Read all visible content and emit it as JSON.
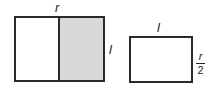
{
  "diagram": {
    "left_rectangle": {
      "top_label": "r",
      "side_label": "l",
      "shaded_half": "right",
      "shade_color": "#d8d8d8"
    },
    "right_rectangle": {
      "top_label": "l",
      "side_label": {
        "numerator": "r",
        "denominator": "2"
      }
    }
  }
}
